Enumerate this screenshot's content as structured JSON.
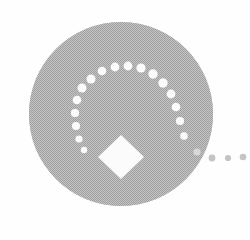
{
  "graphic": {
    "title": "Spiral Dot Emblem",
    "alt_text": "Gray circle with a spiral of white dots, a white diamond and three trailing dots",
    "canvas": {
      "width": 250,
      "height": 240,
      "background_color": "#fefefe"
    },
    "disc": {
      "name": "gray-disc",
      "center_x": 121,
      "center_y": 114,
      "radius": 92,
      "fill_color": "#b2b2b2",
      "texture": "halftone-dither",
      "texture_dark_color": "#9a9a9a",
      "texture_light_color": "#c6c6c6"
    },
    "diamond": {
      "name": "white-diamond",
      "center_x": 121,
      "center_y": 157,
      "half_width": 23,
      "half_height": 22,
      "rotation_deg": 45,
      "fill_color": "#fbfbfb"
    },
    "spiral_dots": {
      "fill_color": "#fbfbfb",
      "count": 17,
      "description": "Arc of white dots spiralling counter-clockwise from lower-left up and around to lower-right, growing in radius",
      "points": [
        {
          "x": 84,
          "y": 150,
          "r": 3.2
        },
        {
          "x": 79,
          "y": 139,
          "r": 3.6
        },
        {
          "x": 76,
          "y": 126,
          "r": 4.0
        },
        {
          "x": 75,
          "y": 113,
          "r": 4.1
        },
        {
          "x": 77,
          "y": 100,
          "r": 4.3
        },
        {
          "x": 82,
          "y": 88,
          "r": 4.5
        },
        {
          "x": 91,
          "y": 79,
          "r": 4.5
        },
        {
          "x": 102,
          "y": 71,
          "r": 4.3
        },
        {
          "x": 115,
          "y": 67,
          "r": 4.4
        },
        {
          "x": 128,
          "y": 66,
          "r": 4.4
        },
        {
          "x": 141,
          "y": 68,
          "r": 4.6
        },
        {
          "x": 153,
          "y": 74,
          "r": 4.7
        },
        {
          "x": 163,
          "y": 83,
          "r": 4.7
        },
        {
          "x": 171,
          "y": 94,
          "r": 4.4
        },
        {
          "x": 176,
          "y": 107,
          "r": 4.3
        },
        {
          "x": 180,
          "y": 121,
          "r": 4.1
        },
        {
          "x": 184,
          "y": 136,
          "r": 3.8
        }
      ]
    },
    "trailing_dots": {
      "fill_color": "#c4c4c4",
      "count": 3,
      "description": "Three small gray dots continuing the spiral outside the disc edge toward the right",
      "points": [
        {
          "x": 212,
          "y": 158,
          "r": 3.4
        },
        {
          "x": 228,
          "y": 158,
          "r": 3.1
        },
        {
          "x": 243,
          "y": 157,
          "r": 3.3
        }
      ]
    },
    "edge_dot": {
      "name": "disc-edge-dot",
      "x": 197,
      "y": 152,
      "r": 3.6,
      "fill_color": "#d8d8d8"
    }
  }
}
